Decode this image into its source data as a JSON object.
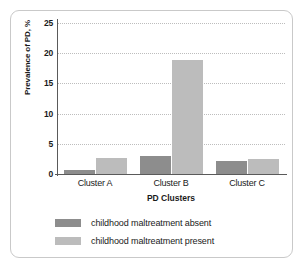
{
  "chart_data": {
    "type": "bar",
    "title": "",
    "xlabel": "PD Clusters",
    "ylabel": "Prevalence of PD, %",
    "categories": [
      "Cluster A",
      "Cluster B",
      "Cluster C"
    ],
    "series": [
      {
        "name": "childhood maltreatment absent",
        "values": [
          0.6,
          3.0,
          2.1
        ],
        "color": "#8d8d8d"
      },
      {
        "name": "childhood maltreatment present",
        "values": [
          2.7,
          18.9,
          2.5
        ],
        "color": "#bcbcbc"
      }
    ],
    "ylim": [
      0,
      25
    ],
    "yticks": [
      "0",
      "5",
      "10",
      "15",
      "20",
      "25"
    ],
    "ytick_values": [
      0,
      5,
      10,
      15,
      20,
      25
    ],
    "grid": true,
    "legend_position": "bottom"
  },
  "legend": {
    "items": [
      {
        "label": "childhood maltreatment absent",
        "swatch": "absent"
      },
      {
        "label": "childhood maltreatment present",
        "swatch": "present"
      }
    ]
  },
  "colors": {
    "absent": "#8d8d8d",
    "present": "#bcbcbc",
    "axis": "#5a5a5a",
    "grid": "#bdbdbd",
    "border": "#c9c9c9",
    "text": "#1a1a1a"
  }
}
